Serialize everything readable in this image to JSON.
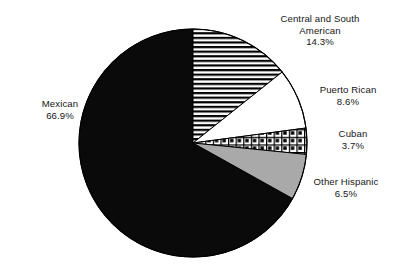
{
  "chart_data": {
    "type": "pie",
    "title": "",
    "xlabel": "",
    "ylabel": "",
    "legend_position": "none",
    "grid": false,
    "start_angle_deg": 0,
    "direction": "clockwise",
    "unit": "%",
    "categories": [
      "Central and South American",
      "Puerto Rican",
      "Cuban",
      "Other Hispanic",
      "Mexican"
    ],
    "values": [
      14.3,
      8.6,
      3.7,
      6.5,
      66.9
    ],
    "slices": [
      {
        "name": "Central and South American",
        "label_line1": "Central and South",
        "label_line2": "American",
        "value": 14.3,
        "value_text": "14.3%",
        "fill_style": "horizontal-stripes",
        "fill_color": "#ffffff",
        "pattern_color": "#000000",
        "start_deg": 0,
        "end_deg": 51.48
      },
      {
        "name": "Puerto Rican",
        "label_line1": "Puerto Rican",
        "label_line2": "",
        "value": 8.6,
        "value_text": "8.6%",
        "fill_style": "solid-white",
        "fill_color": "#ffffff",
        "pattern_color": "#000000",
        "start_deg": 51.48,
        "end_deg": 82.44
      },
      {
        "name": "Cuban",
        "label_line1": "Cuban",
        "label_line2": "",
        "value": 3.7,
        "value_text": "3.7%",
        "fill_style": "checkered-dots",
        "fill_color": "#ffffff",
        "pattern_color": "#000000",
        "start_deg": 82.44,
        "end_deg": 95.76
      },
      {
        "name": "Other Hispanic",
        "label_line1": "Other Hispanic",
        "label_line2": "",
        "value": 6.5,
        "value_text": "6.5%",
        "fill_style": "solid-gray",
        "fill_color": "#a9a9a9",
        "pattern_color": "#000000",
        "start_deg": 95.76,
        "end_deg": 119.16
      },
      {
        "name": "Mexican",
        "label_line1": "Mexican",
        "label_line2": "",
        "value": 66.9,
        "value_text": "66.9%",
        "fill_style": "solid-black",
        "fill_color": "#0a0a0a",
        "pattern_color": "#000000",
        "start_deg": 119.16,
        "end_deg": 360
      }
    ]
  },
  "geometry": {
    "center_x": 193,
    "center_y": 143,
    "radius": 114
  },
  "colors": {
    "background": "#ffffff",
    "outline": "#000000",
    "text": "#161616",
    "gray_slice": "#a9a9a9",
    "black_slice": "#0a0a0a"
  }
}
